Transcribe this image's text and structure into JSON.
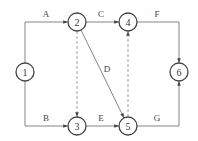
{
  "diagram": {
    "type": "activity-on-arrow network",
    "nodes": [
      {
        "id": "1",
        "label": "1",
        "x": 25,
        "y": 72
      },
      {
        "id": "2",
        "label": "2",
        "x": 77,
        "y": 22
      },
      {
        "id": "3",
        "label": "3",
        "x": 77,
        "y": 126
      },
      {
        "id": "4",
        "label": "4",
        "x": 128,
        "y": 22
      },
      {
        "id": "5",
        "label": "5",
        "x": 128,
        "y": 126
      },
      {
        "id": "6",
        "label": "6",
        "x": 179,
        "y": 72
      }
    ],
    "edges": [
      {
        "from": "1",
        "to": "2",
        "label": "A",
        "style": "solid"
      },
      {
        "from": "1",
        "to": "3",
        "label": "B",
        "style": "solid"
      },
      {
        "from": "2",
        "to": "4",
        "label": "C",
        "style": "solid"
      },
      {
        "from": "2",
        "to": "5",
        "label": "D",
        "style": "solid"
      },
      {
        "from": "3",
        "to": "5",
        "label": "E",
        "style": "solid"
      },
      {
        "from": "4",
        "to": "6",
        "label": "F",
        "style": "solid"
      },
      {
        "from": "5",
        "to": "6",
        "label": "G",
        "style": "solid"
      },
      {
        "from": "2",
        "to": "3",
        "label": "",
        "style": "dashed"
      },
      {
        "from": "5",
        "to": "4",
        "label": "",
        "style": "dashed"
      }
    ]
  }
}
